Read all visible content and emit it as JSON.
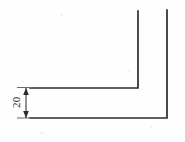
{
  "drawing": {
    "title": "Angle section profile",
    "type": "engineering-line-drawing",
    "canvas": {
      "width": 185,
      "height": 142,
      "background": "#fefefe"
    },
    "line_color": "#2b2b2b",
    "dimension_color": "#3a3a3a",
    "extension_color": "#6a6a6a",
    "part": {
      "name": "L-shaped angle bracket cross-section",
      "outline_path": "M 30 88 L 138 88 L 138 11 M 167 10 L 167 118 L 30 118",
      "segments": [
        {
          "name": "inner-horizontal-leg",
          "x1": 30,
          "y1": 88,
          "x2": 138,
          "y2": 88
        },
        {
          "name": "inner-vertical-leg",
          "x1": 138,
          "y1": 88,
          "x2": 138,
          "y2": 11
        },
        {
          "name": "outer-vertical-leg",
          "x1": 167,
          "y1": 10,
          "x2": 167,
          "y2": 118
        },
        {
          "name": "outer-horizontal-leg",
          "x1": 167,
          "y1": 118,
          "x2": 30,
          "y2": 118
        }
      ]
    },
    "dimension": {
      "name": "thickness-dimension",
      "label": "20",
      "orientation": "vertical",
      "text_rotation_deg": -90,
      "text_x": 20,
      "text_y": 108,
      "line_x": 26,
      "line_y1": 88,
      "line_y2": 118,
      "extension_top": {
        "x1": 17,
        "y1": 87.5,
        "x2": 32,
        "y2": 87.5
      },
      "extension_bottom": {
        "x1": 17,
        "y1": 118,
        "x2": 32,
        "y2": 118
      },
      "arrow_top": "26,88 23.2,95 28.8,95",
      "arrow_bottom": "26,118 23.2,111 28.8,111"
    }
  }
}
